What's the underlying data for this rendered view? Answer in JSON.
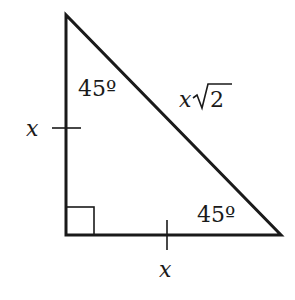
{
  "diagram": {
    "type": "right-isosceles-triangle",
    "angles": {
      "top": "45º",
      "bottom_right": "45º",
      "bottom_left": "right-angle"
    },
    "sides": {
      "left_leg": "x",
      "bottom_leg": "x",
      "hypotenuse_var": "x",
      "hypotenuse_radicand": "2"
    },
    "colors": {
      "stroke": "#1a1a1a",
      "background": "#ffffff"
    }
  }
}
